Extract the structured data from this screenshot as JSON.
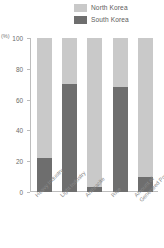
{
  "legend": {
    "position": "top-right",
    "entries": [
      {
        "label": "North Korea",
        "color": "#c9c9c9"
      },
      {
        "label": "South Korea",
        "color": "#6e6e6e"
      }
    ]
  },
  "axis": {
    "unit_label": "(%)",
    "y_ticks": [
      "100",
      "80",
      "60",
      "40",
      "20",
      "0"
    ]
  },
  "chart_data": {
    "type": "bar",
    "title": "",
    "subtitle": "",
    "xlabel": "",
    "ylabel": "(%)",
    "ylim": [
      0,
      100
    ],
    "grid": false,
    "stacked": true,
    "stacked_total": 100,
    "legend_position": "top-right",
    "categories": [
      "Heavy Industry",
      "Light Industry",
      "Anthracite",
      "Rice",
      "Amount of Generated Power"
    ],
    "series": [
      {
        "name": "South Korea",
        "color": "#6e6e6e",
        "values": [
          22,
          70,
          3,
          68,
          10
        ]
      },
      {
        "name": "North Korea",
        "color": "#c9c9c9",
        "values": [
          78,
          30,
          97,
          32,
          90
        ]
      }
    ],
    "tick_labels": {
      "y": [
        "0",
        "20",
        "40",
        "60",
        "80",
        "100"
      ]
    }
  }
}
